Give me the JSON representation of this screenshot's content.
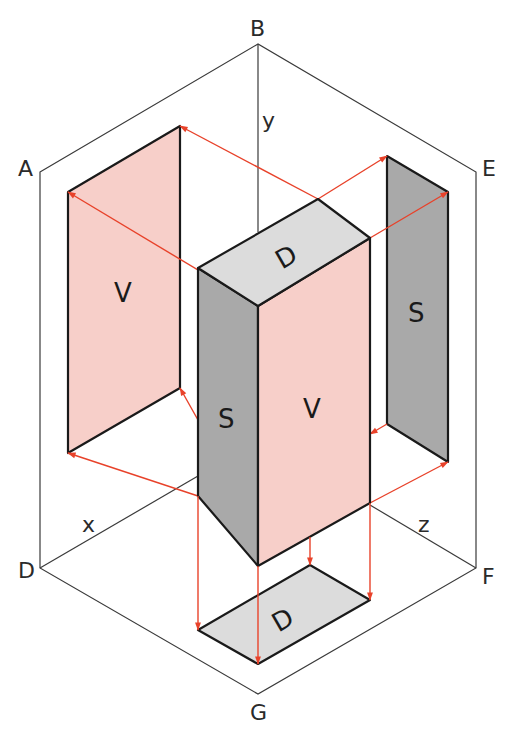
{
  "diagram": {
    "type": "isometric-orthographic-projection",
    "corner_labels": {
      "A": "A",
      "B": "B",
      "E": "E",
      "F": "F",
      "G": "G",
      "D": "D"
    },
    "axis_labels": {
      "x": "x",
      "y": "y",
      "z": "z"
    },
    "face_labels": {
      "front_view": "V",
      "side_view": "S",
      "top_view": "D"
    },
    "projected_faces": {
      "left_panel": "V",
      "right_panel": "S",
      "bottom_panel": "D"
    },
    "colors": {
      "front_face": "#f7cfc9",
      "side_face": "#a9a9a9",
      "top_face": "#dcdcdc",
      "projection_lines": "#e8422a",
      "frame_lines": "#3a3a3a"
    }
  }
}
